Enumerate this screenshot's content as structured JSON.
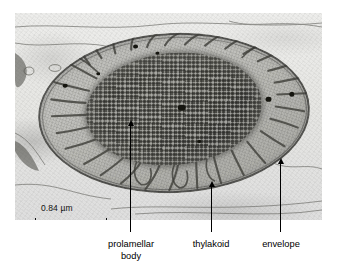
{
  "figure": {
    "type": "transmission-electron-micrograph",
    "scale_bar": {
      "text": "0.84 µm",
      "value": 0.84,
      "unit": "µm",
      "bar_length_px": 72
    },
    "background_color": "#ffffff",
    "plate_color": "#e8e8e6"
  },
  "annotations": [
    {
      "id": "prolamellar-body",
      "label_line1": "prolamellar",
      "label_line2": "body",
      "arrow_tip_x": 130,
      "arrow_tip_y": 125,
      "arrow_base_y": 232
    },
    {
      "id": "thylakoid",
      "label_line1": "thylakoid",
      "label_line2": "",
      "arrow_tip_x": 211,
      "arrow_tip_y": 186,
      "arrow_base_y": 232
    },
    {
      "id": "envelope",
      "label_line1": "envelope",
      "label_line2": "",
      "arrow_tip_x": 280,
      "arrow_tip_y": 163,
      "arrow_base_y": 232
    }
  ]
}
